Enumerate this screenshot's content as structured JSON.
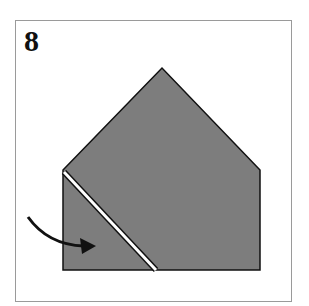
{
  "step": {
    "number": "8"
  },
  "colors": {
    "paper_fill": "#7d7d7d",
    "outline": "#111111",
    "crease_gap": "#ffffff",
    "arrow": "#111111",
    "frame_border": "#9a9a9a"
  },
  "shape": {
    "name": "pentagon-house-fold",
    "points": "63,170 162,68 260,170 260,270 63,270"
  },
  "fold_line": {
    "x1": 64,
    "y1": 172,
    "x2": 156,
    "y2": 270
  },
  "arrow": {
    "path": "M28,217 Q48,245 84,246",
    "direction": "right"
  }
}
